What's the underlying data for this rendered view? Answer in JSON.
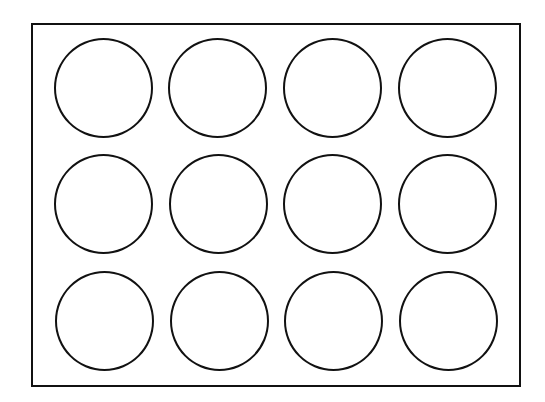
{
  "diagram": {
    "type": "grid-of-circles",
    "rows": 3,
    "columns": 4,
    "stroke_color": "#111111",
    "fill_color": "#ffffff",
    "circles": [
      {
        "row": 1,
        "col": 1,
        "cx": 103,
        "cy": 88
      },
      {
        "row": 1,
        "col": 2,
        "cx": 217,
        "cy": 88
      },
      {
        "row": 1,
        "col": 3,
        "cx": 332,
        "cy": 88
      },
      {
        "row": 1,
        "col": 4,
        "cx": 447,
        "cy": 88
      },
      {
        "row": 2,
        "col": 1,
        "cx": 103,
        "cy": 204
      },
      {
        "row": 2,
        "col": 2,
        "cx": 218,
        "cy": 204
      },
      {
        "row": 2,
        "col": 3,
        "cx": 332,
        "cy": 204
      },
      {
        "row": 2,
        "col": 4,
        "cx": 447,
        "cy": 204
      },
      {
        "row": 3,
        "col": 1,
        "cx": 104,
        "cy": 321
      },
      {
        "row": 3,
        "col": 2,
        "cx": 219,
        "cy": 321
      },
      {
        "row": 3,
        "col": 3,
        "cx": 333,
        "cy": 321
      },
      {
        "row": 3,
        "col": 4,
        "cx": 448,
        "cy": 321
      }
    ]
  }
}
